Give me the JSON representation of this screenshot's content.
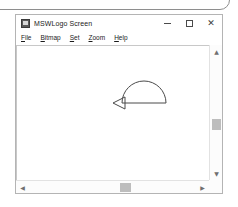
{
  "background_window": {
    "name": "background-window-edge"
  },
  "window": {
    "title": "MSWLogo Screen",
    "icon": "mswlogo-app-icon",
    "controls": {
      "minimize": "–",
      "maximize": "□",
      "close": "✕",
      "minimize_label": "Minimize",
      "maximize_label": "Maximize",
      "close_label": "Close"
    }
  },
  "menu": {
    "items": [
      {
        "label": "File",
        "mnemonic": "F",
        "rest": "ile"
      },
      {
        "label": "Bitmap",
        "mnemonic": "B",
        "rest": "itmap"
      },
      {
        "label": "Set",
        "mnemonic": "S",
        "rest": "et"
      },
      {
        "label": "Zoom",
        "mnemonic": "Z",
        "rest": "oom"
      },
      {
        "label": "Help",
        "mnemonic": "H",
        "rest": "elp"
      }
    ]
  },
  "canvas": {
    "name": "logo-drawing-canvas",
    "background_color": "#ffffff",
    "pen_color": "#4a4a4a",
    "drawing": {
      "description": "semicircle arc with horizontal baseline and turtle cursor",
      "arc": {
        "center_x": 127,
        "center_y": 57,
        "radius": 22,
        "start_angle_deg": 180,
        "end_angle_deg": 360
      },
      "baseline": {
        "x1": 105,
        "y1": 57,
        "x2": 149,
        "y2": 57
      },
      "turtle": {
        "x": 105,
        "y": 57,
        "heading_deg": 270,
        "shape": "triangle-outline",
        "size": 9
      }
    }
  },
  "scrollbars": {
    "vertical": {
      "up_arrow": "▲",
      "down_arrow": "▼",
      "thumb_position_pct": 62
    },
    "horizontal": {
      "left_arrow": "◀",
      "right_arrow": "▶",
      "thumb_position_pct": 58
    }
  }
}
